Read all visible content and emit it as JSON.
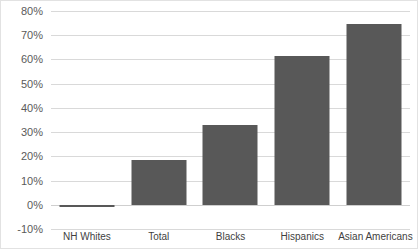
{
  "chart_data": {
    "type": "bar",
    "title": "",
    "subtitle": "",
    "xlabel": "",
    "ylabel": "",
    "categories": [
      "NH Whites",
      "Total",
      "Blacks",
      "Hispanics",
      "Asian Americans"
    ],
    "values": [
      -1,
      18.5,
      33,
      61.5,
      74.5
    ],
    "value_suffix": "%",
    "ylim": [
      -10,
      80
    ],
    "ytick_values": [
      80,
      70,
      60,
      50,
      40,
      30,
      20,
      10,
      0,
      -10
    ],
    "ytick_labels": [
      "80%",
      "70%",
      "60%",
      "50%",
      "40%",
      "30%",
      "20%",
      "10%",
      "0%",
      "-10%"
    ],
    "grid": true,
    "legend": false,
    "legend_position": "none",
    "series": [
      {
        "name": "",
        "values": [
          -1,
          18.5,
          33,
          61.5,
          74.5
        ]
      }
    ],
    "colors": {
      "bar": "#585858",
      "gridline": "#d9d9d9",
      "frame_border": "#e2e2e2",
      "background": "#ffffff",
      "tick_label": "#5a5a5a",
      "category_label": "#3f3f3f"
    }
  }
}
